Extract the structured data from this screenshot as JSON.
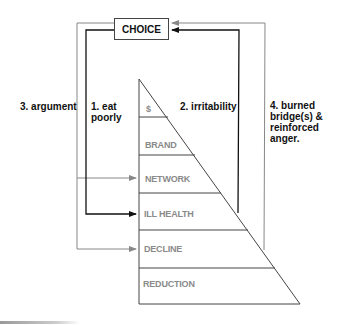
{
  "diagram": {
    "choice_label": "CHOICE",
    "tiers": [
      {
        "label": "$"
      },
      {
        "label": "BRAND"
      },
      {
        "label": "NETWORK"
      },
      {
        "label": "ILL HEALTH"
      },
      {
        "label": "DECLINE"
      },
      {
        "label": "REDUCTION"
      }
    ],
    "loops": [
      {
        "label_lines": [
          "1. eat",
          "poorly"
        ],
        "color": "#111111",
        "target": "ILL HEALTH"
      },
      {
        "label_lines": [
          "2. irritability"
        ],
        "color": "#111111",
        "source": "ILL HEALTH"
      },
      {
        "label_lines": [
          "3. argument"
        ],
        "color": "#888888",
        "targets": [
          "NETWORK",
          "DECLINE"
        ]
      },
      {
        "label_lines": [
          "4. burned",
          "bridge(s) &",
          "reinforced",
          "anger."
        ],
        "color": "#888888",
        "source": "DECLINE"
      }
    ]
  }
}
